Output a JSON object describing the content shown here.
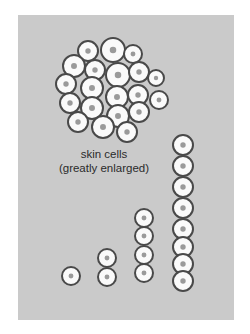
{
  "figure": {
    "caption_line1": "skin cells",
    "caption_line2": "(greatly enlarged)"
  },
  "colors": {
    "page_background": "#ffffff",
    "panel_background": "#cacaca",
    "cell_fill": "#fafafa",
    "cell_outline": "#4a4a4a",
    "nucleus": "#9a9a9a"
  },
  "cluster": {
    "cell_count": 20,
    "cells": [
      {
        "x": 88,
        "y": 51,
        "r": 10
      },
      {
        "x": 113,
        "y": 50,
        "r": 12
      },
      {
        "x": 133,
        "y": 54,
        "r": 9
      },
      {
        "x": 74,
        "y": 66,
        "r": 11
      },
      {
        "x": 95,
        "y": 70,
        "r": 10
      },
      {
        "x": 118,
        "y": 75,
        "r": 12
      },
      {
        "x": 139,
        "y": 72,
        "r": 10
      },
      {
        "x": 156,
        "y": 78,
        "r": 8
      },
      {
        "x": 66,
        "y": 84,
        "r": 10
      },
      {
        "x": 92,
        "y": 88,
        "r": 11
      },
      {
        "x": 117,
        "y": 97,
        "r": 11
      },
      {
        "x": 138,
        "y": 95,
        "r": 10
      },
      {
        "x": 159,
        "y": 100,
        "r": 9
      },
      {
        "x": 70,
        "y": 103,
        "r": 10
      },
      {
        "x": 92,
        "y": 108,
        "r": 11
      },
      {
        "x": 118,
        "y": 116,
        "r": 11
      },
      {
        "x": 139,
        "y": 112,
        "r": 10
      },
      {
        "x": 78,
        "y": 122,
        "r": 10
      },
      {
        "x": 103,
        "y": 127,
        "r": 11
      },
      {
        "x": 127,
        "y": 132,
        "r": 10
      }
    ]
  },
  "columns": [
    {
      "label": "1 cell",
      "x": 71,
      "cells_y": [
        276
      ],
      "r": 9
    },
    {
      "label": "2 cells",
      "x": 107,
      "cells_y": [
        258,
        277
      ],
      "r": 9
    },
    {
      "label": "4 cells",
      "x": 144,
      "cells_y": [
        218,
        236,
        255,
        273
      ],
      "r": 9
    },
    {
      "label": "8 cells",
      "x": 183,
      "cells_y": [
        145,
        166,
        187,
        208,
        229,
        247,
        264,
        281
      ],
      "r": 10
    }
  ]
}
